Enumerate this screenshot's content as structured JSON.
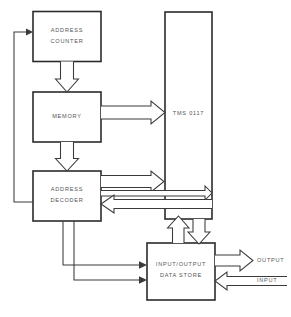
{
  "diagram": {
    "type": "block-diagram",
    "background_color": "#ffffff",
    "line_color": "#3a3a3a",
    "box_border_color": "#2b2b2b",
    "text_color": "#555555",
    "blocks": [
      {
        "id": "address-counter",
        "label_line1": "ADDRESS",
        "label_line2": "COUNTER"
      },
      {
        "id": "memory",
        "label_line1": "MEMORY",
        "label_line2": ""
      },
      {
        "id": "address-decoder",
        "label_line1": "ADDRESS",
        "label_line2": "DECODER"
      },
      {
        "id": "tms-0117",
        "label_line1": "TMS 0117",
        "label_line2": ""
      },
      {
        "id": "io-data-store",
        "label_line1": "INPUT/OUTPUT",
        "label_line2": "DATA STORE"
      }
    ],
    "external_labels": [
      {
        "id": "output",
        "text": "OUTPUT"
      },
      {
        "id": "input",
        "text": "INPUT"
      }
    ],
    "connections": [
      {
        "from": "address-counter",
        "to": "memory",
        "style": "hollow-bus",
        "direction": "down"
      },
      {
        "from": "memory",
        "to": "address-decoder",
        "style": "hollow-bus",
        "direction": "down"
      },
      {
        "from": "memory",
        "to": "tms-0117",
        "style": "hollow-bus",
        "direction": "right"
      },
      {
        "from": "address-decoder",
        "to": "tms-0117",
        "style": "hollow-bus",
        "direction": "right"
      },
      {
        "from": "address-decoder",
        "to": "tms-0117",
        "style": "hollow-bus",
        "direction": "right"
      },
      {
        "from": "tms-0117",
        "to": "address-decoder",
        "style": "hollow-bus",
        "direction": "left"
      },
      {
        "from": "io-data-store",
        "to": "tms-0117",
        "style": "hollow-bus",
        "direction": "up"
      },
      {
        "from": "tms-0117",
        "to": "io-data-store",
        "style": "hollow-bus",
        "direction": "down"
      },
      {
        "from": "address-decoder",
        "to": "address-counter",
        "style": "thin-line",
        "direction": "up"
      },
      {
        "from": "address-decoder",
        "to": "io-data-store",
        "style": "thin-line",
        "direction": "right"
      },
      {
        "from": "address-decoder",
        "to": "io-data-store",
        "style": "thin-line",
        "direction": "right"
      },
      {
        "from": "io-data-store",
        "to": "output",
        "style": "hollow-bus",
        "direction": "right"
      },
      {
        "from": "input",
        "to": "io-data-store",
        "style": "hollow-bus",
        "direction": "left"
      }
    ]
  }
}
